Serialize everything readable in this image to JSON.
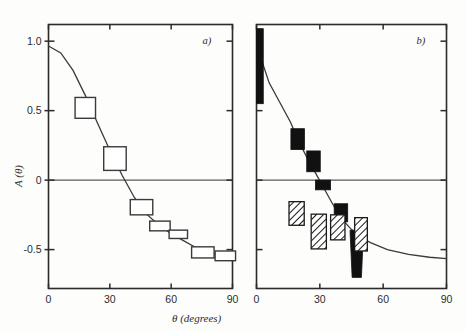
{
  "figure": {
    "background_color": "#fdfdfb",
    "ink_color": "#2b2b2b",
    "xlabel": "θ (degrees)",
    "ylabel": "A (θ)"
  },
  "chart_data": [
    {
      "type": "scatter",
      "panel_label": "a)",
      "title": "",
      "xlabel": "θ (degrees)",
      "ylabel": "A (θ)",
      "xlim": [
        0,
        90
      ],
      "ylim": [
        -0.78,
        1.12
      ],
      "xticks": [
        0,
        30,
        60,
        90
      ],
      "xticklabels": [
        "0",
        "30",
        "60",
        "90"
      ],
      "yticks": [
        1.0,
        0.5,
        0,
        -0.5
      ],
      "yticklabels": [
        "1.0",
        "0.5",
        "0",
        "-0.5"
      ],
      "grid": false,
      "zero_line": true,
      "legend": "none",
      "marker_style": "open-rectangle",
      "points": [
        {
          "x": 18.0,
          "y": 0.52,
          "xerr": 5.0,
          "yerr": 0.075
        },
        {
          "x": 32.5,
          "y": 0.155,
          "xerr": 5.5,
          "yerr": 0.085
        },
        {
          "x": 45.5,
          "y": -0.195,
          "xerr": 5.5,
          "yerr": 0.055
        },
        {
          "x": 54.5,
          "y": -0.33,
          "xerr": 5.0,
          "yerr": 0.035
        },
        {
          "x": 63.5,
          "y": -0.39,
          "xerr": 4.5,
          "yerr": 0.03
        },
        {
          "x": 75.5,
          "y": -0.52,
          "xerr": 5.5,
          "yerr": 0.04
        },
        {
          "x": 86.5,
          "y": -0.545,
          "xerr": 5.0,
          "yerr": 0.035
        }
      ],
      "curve_label": "model A(θ)",
      "curve": [
        {
          "x": 0.0,
          "y": 0.965
        },
        {
          "x": 6.0,
          "y": 0.915
        },
        {
          "x": 12.0,
          "y": 0.79
        },
        {
          "x": 18.0,
          "y": 0.61
        },
        {
          "x": 24.0,
          "y": 0.41
        },
        {
          "x": 30.0,
          "y": 0.215
        },
        {
          "x": 36.0,
          "y": 0.035
        },
        {
          "x": 42.0,
          "y": -0.125
        },
        {
          "x": 48.0,
          "y": -0.245
        },
        {
          "x": 54.0,
          "y": -0.325
        },
        {
          "x": 60.0,
          "y": -0.385
        },
        {
          "x": 66.0,
          "y": -0.435
        },
        {
          "x": 72.0,
          "y": -0.485
        },
        {
          "x": 78.0,
          "y": -0.52
        },
        {
          "x": 84.0,
          "y": -0.54
        },
        {
          "x": 90.0,
          "y": -0.555
        }
      ]
    },
    {
      "type": "scatter",
      "panel_label": "b)",
      "title": "",
      "xlabel": "θ (degrees)",
      "ylabel": "A (θ)",
      "xlim": [
        0,
        90
      ],
      "ylim": [
        -0.78,
        1.12
      ],
      "xticks": [
        0,
        30,
        60,
        90
      ],
      "xticklabels": [
        "0",
        "30",
        "60",
        "90"
      ],
      "yticks": [
        1.0,
        0.5,
        0,
        -0.5
      ],
      "yticklabels": [
        "1.0",
        "0.5",
        "0",
        "-0.5"
      ],
      "grid": false,
      "zero_line": true,
      "legend": "none",
      "marker_style": "filled-and-hatched-rectangles",
      "points_filled": [
        {
          "x": 1.6,
          "y": 0.82,
          "xerr": 1.6,
          "yerr": 0.27
        },
        {
          "x": 19.5,
          "y": 0.295,
          "xerr": 3.2,
          "yerr": 0.075
        },
        {
          "x": 27.0,
          "y": 0.135,
          "xerr": 3.2,
          "yerr": 0.075
        },
        {
          "x": 31.5,
          "y": -0.035,
          "xerr": 3.6,
          "yerr": 0.035
        },
        {
          "x": 40.0,
          "y": -0.235,
          "xerr": 3.2,
          "yerr": 0.065
        }
      ],
      "points_hatched": [
        {
          "x": 19.0,
          "y": -0.24,
          "xerr": 3.6,
          "yerr": 0.085
        },
        {
          "x": 29.5,
          "y": -0.37,
          "xerr": 3.6,
          "yerr": 0.125
        },
        {
          "x": 38.5,
          "y": -0.34,
          "xerr": 3.4,
          "yerr": 0.09
        },
        {
          "x": 49.5,
          "y": -0.39,
          "xerr": 3.0,
          "yerr": 0.12
        }
      ],
      "wedge_marker": {
        "x": 47.5,
        "y_top": -0.36,
        "y_bottom": -0.7,
        "half_width_top": 3.2,
        "half_width_bottom": 2.2
      },
      "curve_label": "model A(θ)",
      "curve": [
        {
          "x": 1.6,
          "y": 0.9
        },
        {
          "x": 6.0,
          "y": 0.7
        },
        {
          "x": 11.0,
          "y": 0.56
        },
        {
          "x": 16.0,
          "y": 0.42
        },
        {
          "x": 20.0,
          "y": 0.28
        },
        {
          "x": 24.0,
          "y": 0.16
        },
        {
          "x": 28.0,
          "y": 0.05
        },
        {
          "x": 32.0,
          "y": -0.06
        },
        {
          "x": 36.0,
          "y": -0.17
        },
        {
          "x": 40.0,
          "y": -0.27
        },
        {
          "x": 44.0,
          "y": -0.34
        },
        {
          "x": 48.0,
          "y": -0.4
        },
        {
          "x": 54.0,
          "y": -0.45
        },
        {
          "x": 62.0,
          "y": -0.5
        },
        {
          "x": 72.0,
          "y": -0.535
        },
        {
          "x": 82.0,
          "y": -0.555
        },
        {
          "x": 90.0,
          "y": -0.565
        }
      ]
    }
  ]
}
